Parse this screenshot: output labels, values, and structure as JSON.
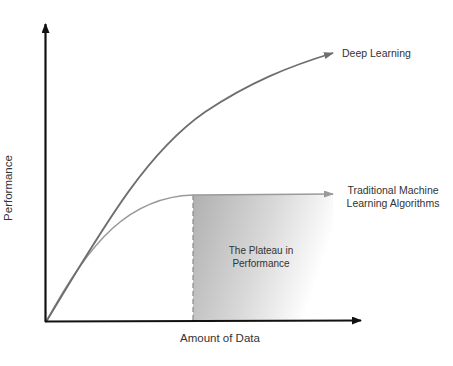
{
  "diagram": {
    "title": "",
    "axes": {
      "x_label": "Amount of Data",
      "y_label": "Performance"
    },
    "curves": [
      {
        "name": "Deep Learning",
        "label": "Deep Learning",
        "color": "#6e6e6e",
        "behavior": "keeps increasing with more data"
      },
      {
        "name": "Traditional Machine Learning Algorithms",
        "label_line1": "Traditional Machine",
        "label_line2": "Learning Algorithms",
        "color": "#9a9a9a",
        "behavior": "rises then plateaus"
      }
    ],
    "region": {
      "label_line1": "The Plateau in",
      "label_line2": "Performance",
      "fill_start": "#b5b5b5",
      "fill_end": "#ffffff"
    },
    "colors": {
      "axis": "#111111",
      "text": "#333333"
    }
  }
}
